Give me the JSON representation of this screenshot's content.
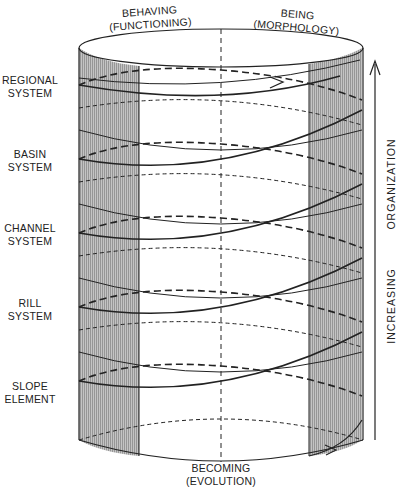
{
  "diagram": {
    "top_labels": {
      "left": {
        "line1": "BEHAVING",
        "line2": "(FUNCTIONING)"
      },
      "right": {
        "line1": "BEING",
        "line2": "(MORPHOLOGY)"
      }
    },
    "bottom_label": {
      "line1": "BECOMING",
      "line2": "(EVOLUTION)"
    },
    "levels": [
      {
        "line1": "REGIONAL",
        "line2": "SYSTEM",
        "y": 80
      },
      {
        "line1": "BASIN",
        "line2": "SYSTEM",
        "y": 154
      },
      {
        "line1": "CHANNEL",
        "line2": "SYSTEM",
        "y": 228
      },
      {
        "line1": "RILL",
        "line2": "SYSTEM",
        "y": 302
      },
      {
        "line1": "SLOPE",
        "line2": "ELEMENT",
        "y": 376
      }
    ],
    "axis_label": {
      "part1": "INCREASING",
      "part2": "ORGANIZATION"
    },
    "colors": {
      "ink": "#222222",
      "shade": "#b8b8b8",
      "background": "#ffffff"
    }
  }
}
